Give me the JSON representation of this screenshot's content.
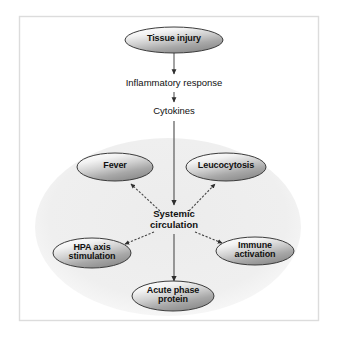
{
  "figure": {
    "background_color": "#ffffff",
    "border_color": "#d9d9d9",
    "halo_color": "#f0f0f0",
    "connector_color": "#555555",
    "text_color": "#101010",
    "node_fill_light": "#fdfdfd",
    "node_fill_mid": "#d0d0d0",
    "node_fill_dark": "#8e8e8e",
    "node_stroke": "#3b3b3b"
  },
  "nodes": [
    {
      "id": "tissue-injury",
      "label": "Tissue injury",
      "shape": "ellipse",
      "cx": 174,
      "cy": 40,
      "rx": 49,
      "ry": 13
    },
    {
      "id": "fever",
      "label": "Fever",
      "shape": "ellipse",
      "cx": 115,
      "cy": 167,
      "rx": 38,
      "ry": 14
    },
    {
      "id": "leucocytosis",
      "label": "Leucocytosis",
      "shape": "ellipse",
      "cx": 226,
      "cy": 167,
      "rx": 40,
      "ry": 14
    },
    {
      "id": "hpa-axis",
      "label": "HPA axis\nstimulation",
      "shape": "ellipse",
      "cx": 92,
      "cy": 253,
      "rx": 39,
      "ry": 15
    },
    {
      "id": "immune",
      "label": "Immune\nactivation",
      "shape": "ellipse",
      "cx": 255,
      "cy": 251,
      "rx": 39,
      "ry": 14
    },
    {
      "id": "acute-phase",
      "label": "Acute phase\nprotein",
      "shape": "ellipse",
      "cx": 173,
      "cy": 296,
      "rx": 41,
      "ry": 15
    }
  ],
  "plain_labels": [
    {
      "id": "inflammatory-response",
      "label": "Inflammatory response",
      "cx": 174,
      "cy": 84
    },
    {
      "id": "cytokines",
      "label": "Cytokines",
      "cx": 174,
      "cy": 112
    },
    {
      "id": "systemic-circulation",
      "label": "Systemic\ncirculation",
      "cx": 174,
      "cy": 220
    }
  ],
  "edges": [
    {
      "id": "tissue-to-inflammatory",
      "from": "tissue-injury",
      "to": "inflammatory-response",
      "style": "solid",
      "arrow": true
    },
    {
      "id": "inflammatory-to-cytokines",
      "from": "inflammatory-response",
      "to": "cytokines",
      "style": "solid",
      "arrow": true
    },
    {
      "id": "cytokines-to-systemic",
      "from": "cytokines",
      "to": "systemic-circulation",
      "style": "solid",
      "arrow": true
    },
    {
      "id": "systemic-to-fever",
      "from": "systemic-circulation",
      "to": "fever",
      "style": "dashed",
      "arrow": true
    },
    {
      "id": "systemic-to-leucocytosis",
      "from": "systemic-circulation",
      "to": "leucocytosis",
      "style": "dashed",
      "arrow": true
    },
    {
      "id": "systemic-to-hpa",
      "from": "systemic-circulation",
      "to": "hpa-axis",
      "style": "dashed",
      "arrow": true
    },
    {
      "id": "systemic-to-immune",
      "from": "systemic-circulation",
      "to": "immune",
      "style": "dashed",
      "arrow": true
    },
    {
      "id": "systemic-to-acute",
      "from": "systemic-circulation",
      "to": "acute-phase",
      "style": "solid",
      "arrow": true
    }
  ]
}
